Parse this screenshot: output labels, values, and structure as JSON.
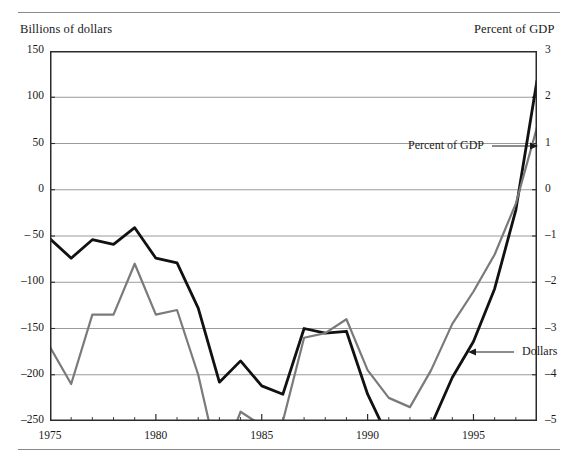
{
  "figure": {
    "left_axis_title": "Billions of dollars",
    "right_axis_title": "Percent of GDP"
  },
  "annotations": {
    "gdp_label": "Percent of GDP",
    "dollars_label": "Dollars"
  },
  "chart_data": {
    "type": "line",
    "title": "",
    "xlabel": "",
    "ylabel": "Billions of dollars",
    "y2label": "Percent of GDP",
    "grid": true,
    "legend": "annotations-inline",
    "xlim": [
      1975,
      1998
    ],
    "ylim": [
      -250,
      150
    ],
    "y2lim": [
      -5,
      3
    ],
    "yticks": [
      150,
      100,
      50,
      0,
      -50,
      -100,
      -150,
      -200,
      -250
    ],
    "ytick_labels": [
      "150",
      "100",
      "50",
      "0",
      "– 50",
      "–100",
      "–150",
      "–200",
      "–250"
    ],
    "y2ticks": [
      3,
      2,
      1,
      0,
      -1,
      -2,
      -3,
      -4,
      -5
    ],
    "y2tick_labels": [
      "3",
      "2",
      "1",
      "0",
      "–1",
      "–2",
      "–3",
      "–4",
      "–5"
    ],
    "xticks": [
      1975,
      1976,
      1977,
      1978,
      1979,
      1980,
      1981,
      1982,
      1983,
      1984,
      1985,
      1986,
      1987,
      1988,
      1989,
      1990,
      1991,
      1992,
      1993,
      1994,
      1995,
      1996,
      1997,
      1998
    ],
    "xtick_labels_shown": [
      "1975",
      "1980",
      "1985",
      "1990",
      "1995"
    ],
    "xtick_labels_years": [
      1975,
      1980,
      1985,
      1990,
      1995
    ],
    "x": [
      1975,
      1976,
      1977,
      1978,
      1979,
      1980,
      1981,
      1982,
      1983,
      1984,
      1985,
      1986,
      1987,
      1988,
      1989,
      1990,
      1991,
      1992,
      1993,
      1994,
      1995,
      1996,
      1997,
      1998
    ],
    "series": [
      {
        "name": "Dollars",
        "axis": "left",
        "color": "#111111",
        "width": 2.8,
        "values": [
          -53,
          -74,
          -54,
          -59,
          -41,
          -74,
          -79,
          -128,
          -208,
          -185,
          -212,
          -221,
          -150,
          -155,
          -153,
          -221,
          -269,
          -290,
          -255,
          -203,
          -164,
          -107,
          -22,
          118
        ]
      },
      {
        "name": "Percent of GDP",
        "axis": "right",
        "color": "#7a7a7a",
        "width": 2.2,
        "values": [
          -3.4,
          -4.2,
          -2.7,
          -2.7,
          -1.6,
          -2.7,
          -2.6,
          -4.0,
          -6.0,
          -4.8,
          -5.1,
          -5.0,
          -3.2,
          -3.1,
          -2.8,
          -3.9,
          -4.5,
          -4.7,
          -3.9,
          -2.9,
          -2.2,
          -1.4,
          -0.3,
          1.35
        ]
      }
    ]
  }
}
